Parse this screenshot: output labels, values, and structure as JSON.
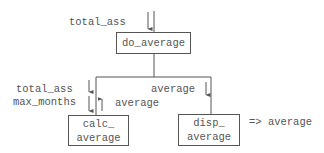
{
  "diagram": {
    "type": "structure-chart",
    "colors": {
      "line": "#555555",
      "text": "#555555",
      "background": "#ffffff"
    },
    "modules": {
      "root": {
        "label": "do_average"
      },
      "left": {
        "line1": "calc_",
        "line2": "average"
      },
      "right": {
        "line1": "disp_",
        "line2": "average"
      }
    },
    "data_flows": {
      "root_in": "total_ass",
      "left_in_1": "total_ass",
      "left_in_2": "max_months",
      "left_out": "average",
      "right_in": "average",
      "right_output": "=> average"
    }
  }
}
